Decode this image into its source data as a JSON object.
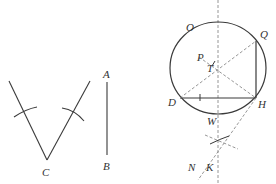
{
  "figure": {
    "type": "geometric-construction",
    "stroke_color": "#3a3a3a",
    "dash_color": "#8a8a8a",
    "labels": {
      "C": "C",
      "A": "A",
      "B": "B",
      "O": "O",
      "Q": "Q",
      "P": "P",
      "T": "T",
      "D": "D",
      "H": "H",
      "W": "W",
      "N": "N",
      "K": "K"
    }
  },
  "left_construction": {
    "angle_vertex": "C",
    "description": "Angle with vertex C, two rays each marked with a compass arc"
  },
  "segment": {
    "endpoints": [
      "A",
      "B"
    ],
    "description": "Vertical segment AB"
  },
  "circle_construction": {
    "circle_label": "O",
    "chord": [
      "D",
      "H"
    ],
    "vertical_segment": [
      "Q",
      "H"
    ],
    "center_point": "T",
    "dashed_lines": [
      "vertical axis through T",
      "D–Q diagonal",
      "P–H diagonal",
      "H–N extension"
    ],
    "intersection_marks": [
      "K"
    ]
  }
}
